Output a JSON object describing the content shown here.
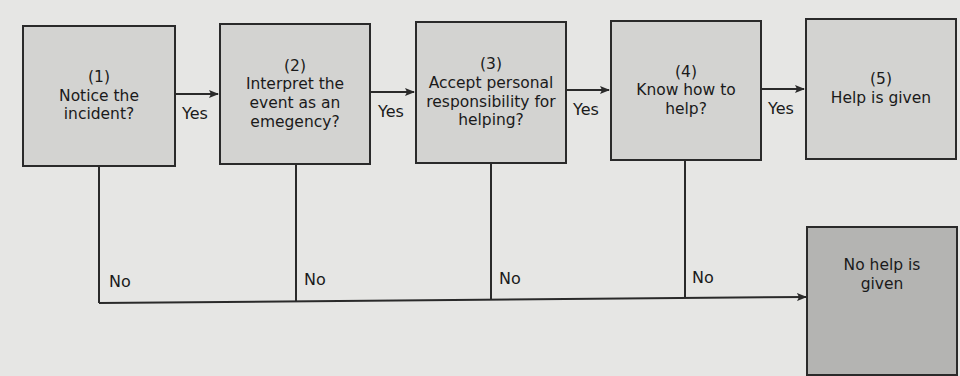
{
  "diagram": {
    "colors": {
      "background": "#e6e6e4",
      "box_fill": "#d3d3d1",
      "no_help_fill": "#b4b4b2",
      "line": "#2a2a2a"
    },
    "steps": [
      {
        "number": "(1)",
        "text": "Notice the\nincident?"
      },
      {
        "number": "(2)",
        "text": "Interpret the\nevent as an\nemegency?"
      },
      {
        "number": "(3)",
        "text": "Accept personal\nresponsibility for\nhelping?"
      },
      {
        "number": "(4)",
        "text": "Know how to\nhelp?"
      },
      {
        "number": "(5)",
        "text": "Help is given"
      }
    ],
    "no_outcome": {
      "text": "No help is\ngiven"
    },
    "yes_labels": [
      "Yes",
      "Yes",
      "Yes",
      "Yes"
    ],
    "no_labels": [
      "No",
      "No",
      "No",
      "No"
    ]
  }
}
